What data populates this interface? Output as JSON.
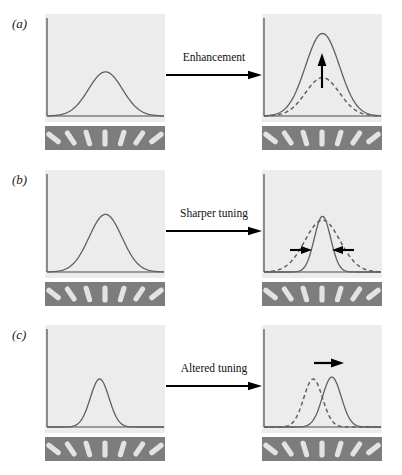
{
  "figure": {
    "background_color": "#ffffff",
    "plot_background_color": "#ececed",
    "curve_color": "#5f5f66",
    "axis_color": "#4a4a4a",
    "stimulus_strip_color": "#7d7d7d",
    "stimulus_bar_color": "#e3e3e0",
    "arrow_color": "#000000"
  },
  "panels": [
    {
      "letter": "(a)",
      "transition_label": "Enhancement",
      "left_plot": {
        "caption": "baseline tuning curve",
        "curve": {
          "style": "solid",
          "peak_height": 0.46,
          "width": 0.36,
          "center": 0.5
        }
      },
      "right_plot": {
        "caption": "enhanced tuning curve with baseline shown dashed",
        "curves": [
          {
            "style": "dashed",
            "peak_height": 0.4,
            "width": 0.36,
            "center": 0.5
          },
          {
            "style": "solid",
            "peak_height": 0.86,
            "width": 0.36,
            "center": 0.5
          }
        ],
        "annotation_arrow": {
          "direction": "up",
          "meaning": "response gain increase"
        }
      }
    },
    {
      "letter": "(b)",
      "transition_label": "Sharper tuning",
      "left_plot": {
        "caption": "baseline tuning curve",
        "curve": {
          "style": "solid",
          "peak_height": 0.6,
          "width": 0.34,
          "center": 0.5
        }
      },
      "right_plot": {
        "caption": "narrowed tuning curve with baseline shown dashed",
        "curves": [
          {
            "style": "dashed",
            "peak_height": 0.54,
            "width": 0.36,
            "center": 0.5
          },
          {
            "style": "solid",
            "peak_height": 0.58,
            "width": 0.17,
            "center": 0.5
          }
        ],
        "annotation_arrows": [
          {
            "direction": "right",
            "meaning": "left flank narrows inward"
          },
          {
            "direction": "left",
            "meaning": "right flank narrows inward"
          }
        ]
      }
    },
    {
      "letter": "(c)",
      "transition_label": "Altered tuning",
      "left_plot": {
        "caption": "baseline narrow tuning curve",
        "curve": {
          "style": "solid",
          "peak_height": 0.5,
          "width": 0.2,
          "center": 0.45
        }
      },
      "right_plot": {
        "caption": "shifted tuning curve with baseline shown dashed",
        "curves": [
          {
            "style": "dashed",
            "peak_height": 0.5,
            "width": 0.2,
            "center": 0.42
          },
          {
            "style": "solid",
            "peak_height": 0.52,
            "width": 0.2,
            "center": 0.58
          }
        ],
        "annotation_arrow": {
          "direction": "right",
          "meaning": "preferred orientation shifts"
        }
      }
    }
  ],
  "stimulus_strip": {
    "description": "row of oriented bars spanning the tuning axis",
    "bar_count": 7,
    "orientations_deg": [
      -52,
      -34,
      -17,
      0,
      17,
      34,
      52
    ]
  },
  "chart_data": {
    "type": "line",
    "xlabel": "Stimulus orientation",
    "ylabel": "Neuronal response",
    "grid": false,
    "legend": null,
    "xlim": [
      0,
      1
    ],
    "ylim": [
      0,
      1
    ],
    "annotations": [
      "(a) Enhancement",
      "(b) Sharper tuning",
      "(c) Altered tuning"
    ],
    "panels": [
      {
        "id": "a-left",
        "series": [
          {
            "name": "baseline",
            "style": "solid",
            "peak": 0.46,
            "center": 0.5,
            "sigma": 0.145
          }
        ]
      },
      {
        "id": "a-right",
        "series": [
          {
            "name": "baseline",
            "style": "dashed",
            "peak": 0.4,
            "center": 0.5,
            "sigma": 0.145
          },
          {
            "name": "attended",
            "style": "solid",
            "peak": 0.86,
            "center": 0.5,
            "sigma": 0.145
          }
        ]
      },
      {
        "id": "b-left",
        "series": [
          {
            "name": "baseline",
            "style": "solid",
            "peak": 0.6,
            "center": 0.5,
            "sigma": 0.14
          }
        ]
      },
      {
        "id": "b-right",
        "series": [
          {
            "name": "baseline",
            "style": "dashed",
            "peak": 0.54,
            "center": 0.5,
            "sigma": 0.15
          },
          {
            "name": "attended",
            "style": "solid",
            "peak": 0.58,
            "center": 0.5,
            "sigma": 0.07
          }
        ]
      },
      {
        "id": "c-left",
        "series": [
          {
            "name": "baseline",
            "style": "solid",
            "peak": 0.5,
            "center": 0.45,
            "sigma": 0.08
          }
        ]
      },
      {
        "id": "c-right",
        "series": [
          {
            "name": "baseline",
            "style": "dashed",
            "peak": 0.5,
            "center": 0.42,
            "sigma": 0.08
          },
          {
            "name": "attended",
            "style": "solid",
            "peak": 0.52,
            "center": 0.58,
            "sigma": 0.08
          }
        ]
      }
    ]
  }
}
